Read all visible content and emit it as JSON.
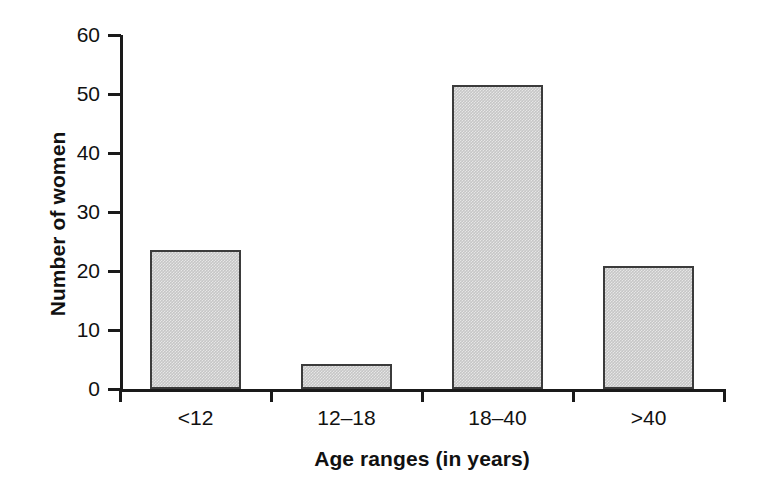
{
  "chart_data": {
    "type": "bar",
    "title": "",
    "subtitle": "",
    "xlabel": "Age ranges (in years)",
    "ylabel": "Number of women",
    "categories": [
      "<12",
      "12–18",
      "18–40",
      ">40"
    ],
    "values": [
      23.5,
      4.3,
      51.5,
      20.9
    ],
    "series": [
      {
        "name": "Number of women",
        "values": [
          23.5,
          4.3,
          51.5,
          20.9
        ]
      }
    ],
    "ylim": [
      0,
      60
    ],
    "yticks": [
      "0",
      "10",
      "20",
      "30",
      "40",
      "50",
      "60"
    ],
    "ytick_values": [
      0,
      10,
      20,
      30,
      40,
      50,
      60
    ],
    "grid": false,
    "legend": "none",
    "bar_fill_color": "#c6c6c6",
    "bar_edge_color": "#3b3b3b",
    "axis_color": "#1a1a1a",
    "background_color": "#ffffff"
  },
  "axes": {
    "y_label": "Number of women",
    "x_label": "Age ranges (in years)"
  }
}
